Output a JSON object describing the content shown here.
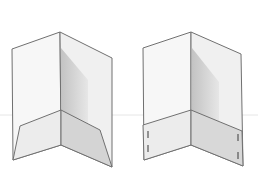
{
  "image": {
    "description": "Line-art product illustration of two open presentation folders",
    "background": "#ffffff",
    "line_color": "#6e6e6e",
    "shadow_color": "#bdbdbd"
  },
  "folders": [
    {
      "name": "left-folder",
      "pocket_style": "angled pocket"
    },
    {
      "name": "right-folder",
      "pocket_style": "straight pocket with business card slits"
    }
  ]
}
